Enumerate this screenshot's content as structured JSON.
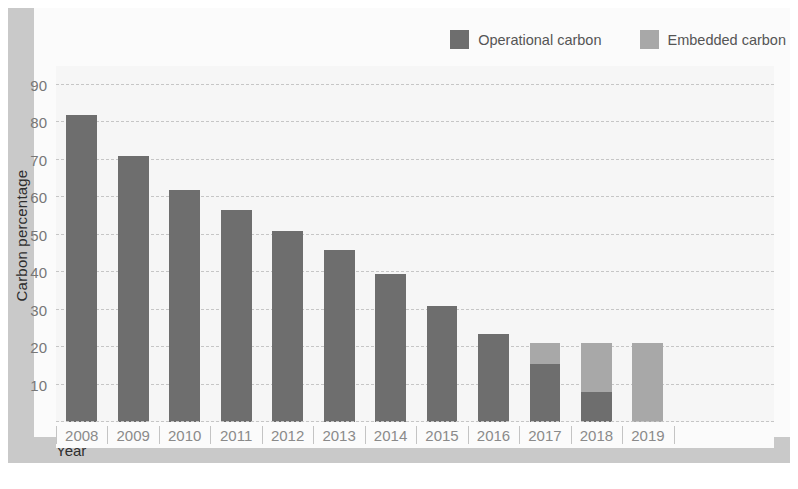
{
  "chart_data": {
    "type": "bar",
    "title": "",
    "xlabel": "Year",
    "ylabel": "Carbon percentage",
    "categories": [
      "2008",
      "2009",
      "2010",
      "2011",
      "2012",
      "2013",
      "2014",
      "2015",
      "2016",
      "2017",
      "2018",
      "2019"
    ],
    "series": [
      {
        "name": "Operational carbon",
        "color": "#6e6e6e",
        "values": [
          82,
          71,
          62,
          56.5,
          51,
          46,
          39.5,
          31,
          23.5,
          15.5,
          8,
          0
        ]
      },
      {
        "name": "Embedded carbon",
        "color": "#a8a8a8",
        "values": [
          21,
          21,
          21,
          21,
          21,
          21,
          21,
          21,
          21,
          21,
          21,
          21
        ]
      }
    ],
    "ylim": [
      0,
      95
    ],
    "yticks": [
      10,
      20,
      30,
      40,
      50,
      60,
      70,
      80,
      90
    ],
    "ytick_labels": [
      "10",
      "20",
      "30",
      "40",
      "50",
      "60",
      "70",
      "80",
      "90"
    ],
    "grid": true,
    "grid_style": "dashed-horizontal",
    "legend_position": "top-right",
    "overlap": "overlaid",
    "background_color": "#f6f6f6",
    "frame_color": "#c9c9c9"
  },
  "legend": {
    "items": [
      {
        "label": "Operational carbon",
        "color": "#6e6e6e"
      },
      {
        "label": "Embedded carbon",
        "color": "#a8a8a8"
      }
    ]
  },
  "axes": {
    "y_title": "Carbon percentage",
    "x_title": "Year"
  }
}
